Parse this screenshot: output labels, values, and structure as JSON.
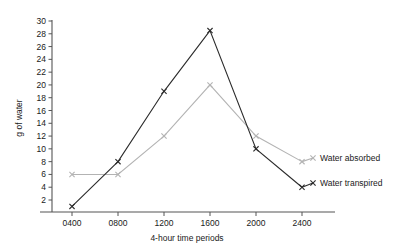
{
  "chart_data": {
    "type": "line",
    "title": "",
    "xlabel": "4-hour time periods",
    "ylabel": "g of water",
    "categories": [
      "0400",
      "0800",
      "1200",
      "1600",
      "2000",
      "2400"
    ],
    "xticklabels": [
      "0400",
      "0800",
      "1200",
      "1600",
      "2000",
      "2400"
    ],
    "yticklabels": [
      "2",
      "4",
      "6",
      "8",
      "10",
      "12",
      "14",
      "16",
      "18",
      "20",
      "22",
      "24",
      "26",
      "28",
      "30"
    ],
    "yticks": [
      2,
      4,
      6,
      8,
      10,
      12,
      14,
      16,
      18,
      20,
      22,
      24,
      26,
      28,
      30
    ],
    "ylim": [
      0,
      30
    ],
    "grid": false,
    "legend_position": "right-inline",
    "marker": "x",
    "series": [
      {
        "name": "Water absorbed",
        "color": "#b3b3b3",
        "values": [
          6,
          6,
          12,
          20,
          12,
          8
        ]
      },
      {
        "name": "Water transpired",
        "color": "#2b2b2b",
        "values": [
          1,
          8,
          19,
          28.5,
          10,
          4
        ]
      }
    ]
  }
}
